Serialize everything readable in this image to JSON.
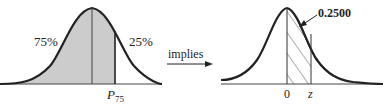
{
  "figure": {
    "left_panel": {
      "left_area_label": "75%",
      "right_area_label": "25%",
      "percentile_label": "P",
      "percentile_subscript": "75",
      "shade_color": "#cccccc"
    },
    "arrow": {
      "label": "implies"
    },
    "right_panel": {
      "area_value": "0.2500",
      "mean_label": "0",
      "z_label": "z",
      "hatch": "diagonal"
    },
    "colors": {
      "curve": "#222222",
      "axis": "#444444"
    }
  }
}
